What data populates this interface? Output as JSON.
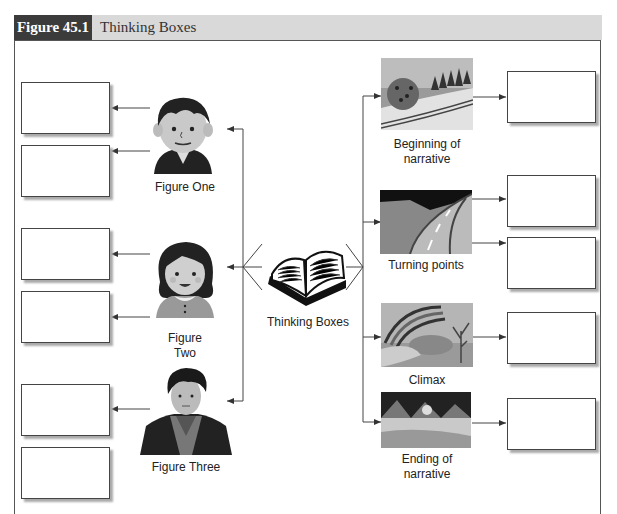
{
  "header": {
    "figure_number": "Figure 45.1",
    "title": "Thinking Boxes"
  },
  "center": {
    "label": "Thinking Boxes",
    "icon": "open-book-icon"
  },
  "characters": [
    {
      "label": "Figure One",
      "icon": "boy-cartoon-icon",
      "boxes": 2
    },
    {
      "label_line1": "Figure",
      "label_line2": "Two",
      "icon": "girl-cartoon-icon",
      "boxes": 2
    },
    {
      "label": "Figure Three",
      "icon": "woman-portrait-icon",
      "boxes": 2
    }
  ],
  "narrative": [
    {
      "label_line1": "Beginning of",
      "label_line2": "narrative",
      "icon": "landscape-trees-icon",
      "boxes": 1
    },
    {
      "label": "Turning points",
      "icon": "winding-road-icon",
      "boxes": 2
    },
    {
      "label": "Climax",
      "icon": "rainbow-landscape-icon",
      "boxes": 1
    },
    {
      "label_line1": "Ending of",
      "label_line2": "narrative",
      "icon": "sunset-mountains-icon",
      "boxes": 1
    }
  ],
  "colors": {
    "header_dark": "#3b3b3b",
    "header_light": "#d9d9d9",
    "line": "#444444"
  }
}
